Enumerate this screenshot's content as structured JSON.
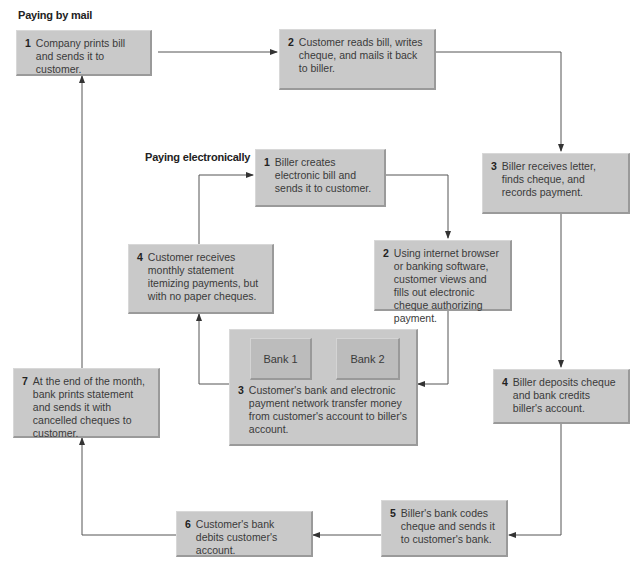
{
  "mail": {
    "heading": "Paying by mail",
    "steps": [
      {
        "num": "1",
        "text": "Company prints bill and sends it to customer."
      },
      {
        "num": "2",
        "text": "Customer reads bill, writes cheque, and mails it back to biller."
      },
      {
        "num": "3",
        "text": "Biller receives letter, finds cheque, and records payment."
      },
      {
        "num": "4",
        "text": "Biller deposits cheque and bank credits biller's account."
      },
      {
        "num": "5",
        "text": "Biller's bank codes cheque and sends it to customer's bank."
      },
      {
        "num": "6",
        "text": "Customer's bank debits customer's account."
      },
      {
        "num": "7",
        "text": "At the end of the month, bank prints statement and sends it with cancelled cheques to customer."
      }
    ]
  },
  "electronic": {
    "heading": "Paying electronically",
    "steps": [
      {
        "num": "1",
        "text": "Biller creates electronic bill and sends it to customer."
      },
      {
        "num": "2",
        "text": "Using internet browser or banking software, customer views and fills out electronic cheque authorizing payment."
      },
      {
        "num": "3",
        "text": "Customer's bank and electronic payment network transfer money from customer's account to biller's account."
      },
      {
        "num": "4",
        "text": "Customer receives monthly statement itemizing payments, but with no paper cheques."
      }
    ],
    "banks": [
      "Bank 1",
      "Bank 2"
    ]
  },
  "colors": {
    "box_fill": "#c9c9c9",
    "line": "#555555"
  }
}
